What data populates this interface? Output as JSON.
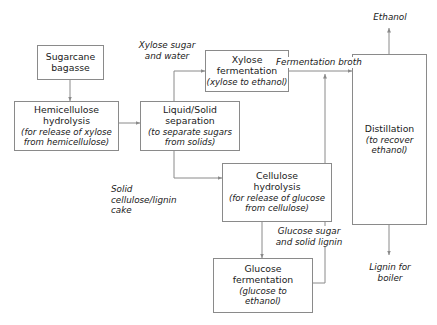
{
  "diagram": {
    "colors": {
      "background": "#ffffff",
      "box_border": "#8a8a8a",
      "line": "#8a8a8a",
      "text": "#1a1a1a"
    },
    "nodes": [
      {
        "id": "sugarcane-bagasse",
        "title_line1": "Sugarcane",
        "title_line2": "bagasse",
        "subtitle": ""
      },
      {
        "id": "hemicellulose-hydrolysis",
        "title_line1": "Hemicellulose",
        "title_line2": "hydrolysis",
        "sub_line1": "(for release of xylose",
        "sub_line2": "from hemicellulose)"
      },
      {
        "id": "liquid-solid-separation",
        "title_line1": "Liquid/Solid",
        "title_line2": "separation",
        "sub_line1": "(to separate sugars",
        "sub_line2": "from solids)"
      },
      {
        "id": "xylose-fermentation",
        "title_line1": "Xylose",
        "title_line2": "fermentation",
        "sub_line1": "(xylose to ethanol)"
      },
      {
        "id": "cellulose-hydrolysis",
        "title_line1": "Cellulose",
        "title_line2": "hydrolysis",
        "sub_line1": "(for release of glucose",
        "sub_line2": "from cellulose)"
      },
      {
        "id": "glucose-fermentation",
        "title_line1": "Glucose",
        "title_line2": "fermentation",
        "sub_line1": "(glucose to",
        "sub_line2": "ethanol)"
      },
      {
        "id": "distillation",
        "title_line1": "Distillation",
        "sub_line1": "(to recover",
        "sub_line2": "ethanol)"
      }
    ],
    "edge_labels": [
      {
        "id": "xylose-sugar-and-water",
        "line1": "Xylose sugar",
        "line2": "and water"
      },
      {
        "id": "fermentation-broth",
        "line1": "Fermentation broth"
      },
      {
        "id": "solid-cellulose-lignin-cake",
        "line1": "Solid",
        "line2": "cellulose/lignin",
        "line3": "cake"
      },
      {
        "id": "glucose-sugar-and-solid-lignin",
        "line1": "Glucose sugar",
        "line2": "and solid lignin"
      }
    ],
    "io_labels": [
      {
        "id": "ethanol-output",
        "line1": "Ethanol"
      },
      {
        "id": "lignin-for-boiler-output",
        "line1": "Lignin for",
        "line2": "boiler"
      }
    ]
  }
}
